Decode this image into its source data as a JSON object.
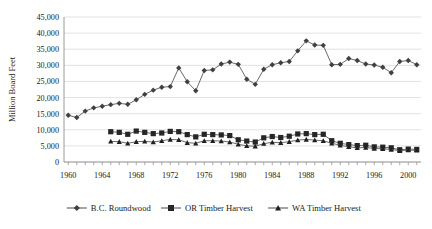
{
  "chart_data": {
    "type": "line",
    "title": "",
    "xlabel": "",
    "ylabel": "Million Board Feet",
    "xlim": [
      1959.5,
      2001.5
    ],
    "ylim": [
      0,
      45000
    ],
    "ytick_labels": [
      "45,000",
      "40,000",
      "35,000",
      "30,000",
      "25,000",
      "20,000",
      "15,000",
      "10,000",
      "5,000",
      "0"
    ],
    "ytick_values": [
      45000,
      40000,
      35000,
      30000,
      25000,
      20000,
      15000,
      10000,
      5000,
      0
    ],
    "xtick_labels": [
      "1960",
      "1964",
      "1968",
      "1972",
      "1976",
      "1980",
      "1984",
      "1988",
      "1992",
      "1996",
      "2000"
    ],
    "xtick_values": [
      1960,
      1964,
      1968,
      1972,
      1976,
      1980,
      1984,
      1988,
      1992,
      1996,
      2000
    ],
    "xtick_minor_step": 1,
    "grid": "horizontal",
    "legend_position": "bottom",
    "marker_color": "#404040",
    "line_color": "#595959",
    "series": [
      {
        "name": "B.C. Roundwood",
        "marker": "diamond",
        "x": [
          1960,
          1961,
          1962,
          1963,
          1964,
          1965,
          1966,
          1967,
          1968,
          1969,
          1970,
          1971,
          1972,
          1973,
          1974,
          1975,
          1976,
          1977,
          1978,
          1979,
          1980,
          1981,
          1982,
          1983,
          1984,
          1985,
          1986,
          1987,
          1988,
          1989,
          1990,
          1991,
          1992,
          1993,
          1994,
          1995,
          1996,
          1997,
          1998,
          1999,
          2000,
          2001
        ],
        "values": [
          14500,
          13800,
          15800,
          16800,
          17300,
          17800,
          18200,
          17900,
          19300,
          21000,
          22300,
          23200,
          23400,
          29200,
          24900,
          22100,
          28400,
          28600,
          30400,
          31000,
          30300,
          25700,
          24100,
          28800,
          30200,
          30800,
          31200,
          34500,
          37600,
          36300,
          36200,
          30200,
          30300,
          32100,
          31500,
          30400,
          30100,
          29400,
          27700,
          31200,
          31500,
          30200
        ]
      },
      {
        "name": "OR Timber Harvest",
        "marker": "square",
        "x": [
          1965,
          1966,
          1967,
          1968,
          1969,
          1970,
          1971,
          1972,
          1973,
          1974,
          1975,
          1976,
          1977,
          1978,
          1979,
          1980,
          1981,
          1982,
          1983,
          1984,
          1985,
          1986,
          1987,
          1988,
          1989,
          1990,
          1991,
          1992,
          1993,
          1994,
          1995,
          1996,
          1997,
          1998,
          1999,
          2000,
          2001
        ],
        "values": [
          9400,
          9200,
          8600,
          9600,
          9200,
          8800,
          9000,
          9500,
          9400,
          8500,
          7800,
          8600,
          8500,
          8400,
          8200,
          6900,
          6500,
          6200,
          7500,
          7900,
          7600,
          8000,
          8700,
          8800,
          8500,
          8600,
          6600,
          5800,
          5400,
          5100,
          5200,
          4700,
          4600,
          4400,
          3800,
          4000,
          3900
        ]
      },
      {
        "name": "WA Timber Harvest",
        "marker": "triangle",
        "x": [
          1965,
          1966,
          1967,
          1968,
          1969,
          1970,
          1971,
          1972,
          1973,
          1974,
          1975,
          1976,
          1977,
          1978,
          1979,
          1980,
          1981,
          1982,
          1983,
          1984,
          1985,
          1986,
          1987,
          1988,
          1989,
          1990,
          1991,
          1992,
          1993,
          1994,
          1995,
          1996,
          1997,
          1998,
          1999,
          2000,
          2001
        ],
        "values": [
          6400,
          6300,
          5800,
          6300,
          6400,
          6200,
          6600,
          7000,
          6900,
          6000,
          5800,
          6600,
          6600,
          6500,
          6200,
          5500,
          5000,
          4900,
          5700,
          6100,
          6000,
          6300,
          6800,
          7000,
          6800,
          6600,
          5800,
          5200,
          4700,
          4400,
          4500,
          4200,
          4100,
          3900,
          3500,
          3700,
          3600
        ]
      }
    ]
  },
  "legend": {
    "items": [
      {
        "label": "B.C. Roundwood",
        "marker": "diamond"
      },
      {
        "label": "OR Timber Harvest",
        "marker": "square"
      },
      {
        "label": "WA Timber Harvest",
        "marker": "triangle"
      }
    ]
  }
}
